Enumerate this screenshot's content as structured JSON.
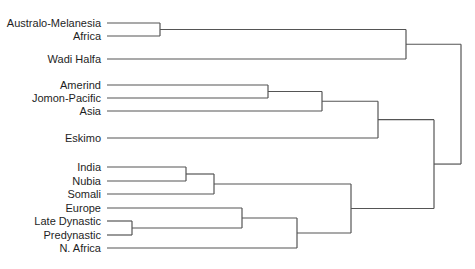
{
  "diagram": {
    "type": "dendrogram",
    "orientation": "leaves-left-root-right",
    "line_color": "#555555",
    "text_color": "#1e1e1e",
    "leaves": [
      {
        "label": "Australo-Melanesia",
        "y": 23
      },
      {
        "label": "Africa",
        "y": 36
      },
      {
        "label": "Wadi Halfa",
        "y": 59
      },
      {
        "label": "Amerind",
        "y": 85
      },
      {
        "label": "Jomon-Pacific",
        "y": 98
      },
      {
        "label": "Asia",
        "y": 111
      },
      {
        "label": "Eskimo",
        "y": 138
      },
      {
        "label": "India",
        "y": 167
      },
      {
        "label": "Nubia",
        "y": 181
      },
      {
        "label": "Somali",
        "y": 194
      },
      {
        "label": "Europe",
        "y": 208
      },
      {
        "label": "Late Dynastic",
        "y": 221
      },
      {
        "label": "Predynastic",
        "y": 235
      },
      {
        "label": "N. Africa",
        "y": 248
      }
    ],
    "merges": [
      {
        "id": "m1",
        "children": [
          "Australo-Melanesia",
          "Africa"
        ],
        "x": 160
      },
      {
        "id": "m2",
        "children": [
          "m1",
          "Wadi Halfa"
        ],
        "x": 406
      },
      {
        "id": "m3",
        "children": [
          "Amerind",
          "Jomon-Pacific"
        ],
        "x": 268
      },
      {
        "id": "m4",
        "children": [
          "m3",
          "Asia"
        ],
        "x": 322
      },
      {
        "id": "m5",
        "children": [
          "m4",
          "Eskimo"
        ],
        "x": 378
      },
      {
        "id": "m6",
        "children": [
          "India",
          "Nubia"
        ],
        "x": 186
      },
      {
        "id": "m7",
        "children": [
          "m6",
          "Somali"
        ],
        "x": 214
      },
      {
        "id": "m8",
        "children": [
          "Late Dynastic",
          "Predynastic"
        ],
        "x": 132
      },
      {
        "id": "m9",
        "children": [
          "Europe",
          "m8"
        ],
        "x": 242
      },
      {
        "id": "m10",
        "children": [
          "m9",
          "N. Africa"
        ],
        "x": 297
      },
      {
        "id": "m11",
        "children": [
          "m7",
          "m10"
        ],
        "x": 351
      },
      {
        "id": "m12",
        "children": [
          "m5",
          "m11"
        ],
        "x": 434
      },
      {
        "id": "m13",
        "children": [
          "m2",
          "m12"
        ],
        "x": 461
      }
    ],
    "leaf_line_start_x": 107
  }
}
